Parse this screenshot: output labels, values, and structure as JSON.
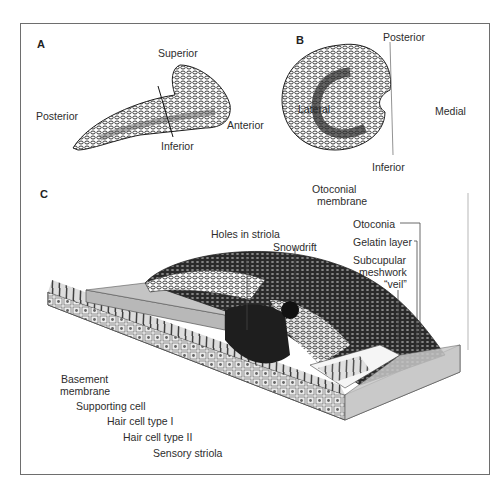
{
  "figure": {
    "panels": [
      {
        "id": "A",
        "label": "A",
        "orientation_labels": {
          "superior": "Superior",
          "posterior": "Posterior",
          "anterior": "Anterior",
          "inferior": "Inferior"
        }
      },
      {
        "id": "B",
        "label": "B",
        "orientation_labels": {
          "posterior": "Posterior",
          "lateral": "Lateral",
          "medial": "Medial",
          "inferior": "Inferior"
        }
      },
      {
        "id": "C",
        "label": "C",
        "structure_labels": {
          "otoconial_membrane_1": "Otoconial",
          "otoconial_membrane_2": "membrane",
          "holes_in_striola": "Holes in striola",
          "snowdrift": "Snowdrift",
          "otoconia": "Otoconia",
          "gelatin_layer": "Gelatin layer",
          "subcupular_1": "Subcupular",
          "subcupular_2": "meshwork",
          "subcupular_3": "“veil”",
          "basement_1": "Basement",
          "basement_2": "membrane",
          "supporting_cell": "Supporting cell",
          "hair_cell_1": "Hair cell type I",
          "hair_cell_2": "Hair cell type II",
          "sensory_striola": "Sensory striola"
        }
      }
    ]
  },
  "colors": {
    "frame": "#6e6e6e",
    "ink": "#1e1e1e",
    "gray_surface": "#bdbdbd",
    "light_surface": "#e6e6e6"
  }
}
